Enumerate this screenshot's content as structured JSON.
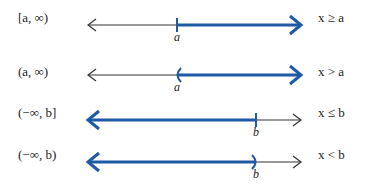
{
  "colors": {
    "highlight": "#1f5aa6",
    "axis": "#333333"
  },
  "rows": [
    {
      "interval": "[a, ∞)",
      "inequality": "x ≥ a",
      "endpoint_label": "a",
      "endpoint_type": "bracket-closed",
      "shaded": "right"
    },
    {
      "interval": "(a, ∞)",
      "inequality": "x > a",
      "endpoint_label": "a",
      "endpoint_type": "paren-open",
      "shaded": "right"
    },
    {
      "interval": "(−∞, b]",
      "inequality": "x ≤ b",
      "endpoint_label": "b",
      "endpoint_type": "bracket-closed",
      "shaded": "left"
    },
    {
      "interval": "(−∞, b)",
      "inequality": "x < b",
      "endpoint_label": "b",
      "endpoint_type": "paren-open",
      "shaded": "left"
    }
  ]
}
